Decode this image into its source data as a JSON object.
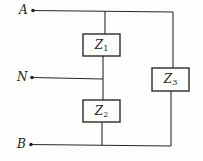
{
  "diagram": {
    "type": "circuit",
    "terminals": [
      {
        "id": "A",
        "label": "A"
      },
      {
        "id": "N",
        "label": "N"
      },
      {
        "id": "B",
        "label": "B"
      }
    ],
    "impedances": [
      {
        "id": "Z1",
        "symbol": "Z",
        "subscript": "1",
        "between": [
          "A",
          "N"
        ]
      },
      {
        "id": "Z2",
        "symbol": "Z",
        "subscript": "2",
        "between": [
          "N",
          "B"
        ]
      },
      {
        "id": "Z3",
        "symbol": "Z",
        "subscript": "3",
        "between": [
          "A",
          "B"
        ]
      }
    ],
    "colors": {
      "line": "#2a2a2a",
      "background": "#fdfdfb"
    }
  }
}
